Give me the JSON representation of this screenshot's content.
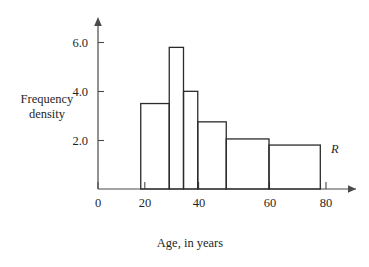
{
  "figure": {
    "background_color": "#ffffff",
    "line_color": "#2b2b2b",
    "axis_color": "#4a4a4a"
  },
  "labels": {
    "y_axis_line1": "Frequency",
    "y_axis_line2": "density",
    "x_axis": "Age, in years",
    "region_marker": "R"
  },
  "chart_data": {
    "type": "bar",
    "title": "",
    "subtitle": "",
    "xlabel": "Age, in years",
    "ylabel": "Frequency density",
    "xlim": [
      0,
      85
    ],
    "ylim": [
      0,
      6.6
    ],
    "grid": false,
    "legend": null,
    "x_ticks": [
      0,
      20,
      40,
      60,
      80
    ],
    "x_tick_labels": [
      "0",
      "20",
      "40",
      "60",
      "80"
    ],
    "y_ticks": [
      2.0,
      4.0,
      6.0
    ],
    "y_tick_labels": [
      "2.0",
      "4.0",
      "6.0"
    ],
    "bin_edges": [
      15,
      25,
      30,
      35,
      45,
      60,
      78
    ],
    "categories": [
      "15-25",
      "25-30",
      "30-35",
      "35-45",
      "45-60",
      "60-78"
    ],
    "values": [
      3.5,
      5.8,
      4.0,
      2.75,
      2.05,
      1.8
    ],
    "bars": [
      {
        "start": 15,
        "end": 25,
        "density": 3.5
      },
      {
        "start": 25,
        "end": 30,
        "density": 5.8
      },
      {
        "start": 30,
        "end": 35,
        "density": 4.0
      },
      {
        "start": 35,
        "end": 45,
        "density": 2.75
      },
      {
        "start": 45,
        "end": 60,
        "density": 2.05
      },
      {
        "start": 60,
        "end": 78,
        "density": 1.8
      }
    ],
    "annotations": [
      {
        "text": "R",
        "x": 81,
        "y": 1.95,
        "style": "italic"
      }
    ]
  }
}
